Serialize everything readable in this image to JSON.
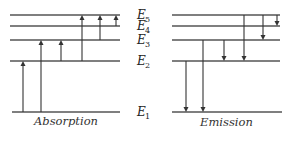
{
  "diagram": {
    "levels": [
      {
        "name": "E",
        "sub": "5",
        "y": 15
      },
      {
        "name": "E",
        "sub": "4",
        "y": 26
      },
      {
        "name": "E",
        "sub": "3",
        "y": 40
      },
      {
        "name": "E",
        "sub": "2",
        "y": 61
      },
      {
        "name": "E",
        "sub": "1",
        "y": 112
      }
    ],
    "panels": {
      "absorption": {
        "caption": "Absorption",
        "transitions": [
          {
            "from": "E1",
            "to": "E2"
          },
          {
            "from": "E1",
            "to": "E3"
          },
          {
            "from": "E2",
            "to": "E3"
          },
          {
            "from": "E2",
            "to": "E5"
          },
          {
            "from": "E3",
            "to": "E5"
          },
          {
            "from": "E4",
            "to": "E5"
          }
        ]
      },
      "emission": {
        "caption": "Emission",
        "transitions": [
          {
            "from": "E2",
            "to": "E1"
          },
          {
            "from": "E3",
            "to": "E1"
          },
          {
            "from": "E3",
            "to": "E2"
          },
          {
            "from": "E5",
            "to": "E2"
          },
          {
            "from": "E5",
            "to": "E3"
          },
          {
            "from": "E5",
            "to": "E4"
          }
        ]
      }
    }
  }
}
